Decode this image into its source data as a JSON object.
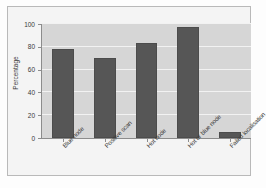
{
  "chart_data": {
    "type": "bar",
    "title": "",
    "xlabel": "",
    "ylabel": "Percentage",
    "ylim": [
      0,
      100
    ],
    "yticks": [
      0,
      20,
      40,
      60,
      80,
      100
    ],
    "grid": true,
    "legend": "none",
    "categories": [
      "Blue node",
      "Positive scan",
      "Hot node",
      "Hot or blue node",
      "Failed localisation"
    ],
    "values": [
      78,
      70,
      83,
      97,
      5
    ],
    "bar_color": "#565656",
    "plot_background": "#d6d6d6",
    "gridline_color": "#f2f2f2",
    "figure_background": "#f4f4f4"
  }
}
